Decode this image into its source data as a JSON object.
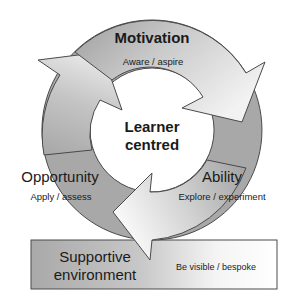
{
  "diagram": {
    "center": {
      "line1": "Learner",
      "line2": "centred"
    },
    "stages": [
      {
        "title": "Motivation",
        "subtitle": "Aware / aspire"
      },
      {
        "title": "Ability",
        "subtitle": "Explore / experiment"
      },
      {
        "title": "Opportunity",
        "subtitle": "Apply / assess"
      }
    ],
    "foundation": {
      "title_line1": "Supportive",
      "title_line2": "environment",
      "subtitle": "Be visible / bespoke"
    },
    "colors": {
      "ring_dark": "#a6a6a6",
      "ring_light": "#ededed",
      "outline": "#4a4a4a",
      "text": "#1a1a1a",
      "background": "#ffffff"
    }
  }
}
